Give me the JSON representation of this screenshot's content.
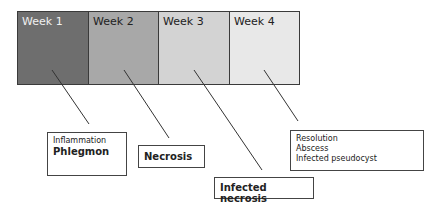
{
  "weeks": [
    {
      "label": "Week 1",
      "color": "#6e6e6e",
      "text_color": "#f0f0f0"
    },
    {
      "label": "Week 2",
      "color": "#a8a8a8",
      "text_color": "#222222"
    },
    {
      "label": "Week 3",
      "color": "#d3d3d3",
      "text_color": "#222222"
    },
    {
      "label": "Week 4",
      "color": "#e8e8e8",
      "text_color": "#222222"
    }
  ],
  "callouts": {
    "week1": {
      "line1": "Inflammation",
      "line2": "Phlegmon"
    },
    "week2": {
      "line1": "Necrosis"
    },
    "week3": {
      "line1": "Infected necrosis"
    },
    "week4": {
      "line1": "Resolution",
      "line2": "Abscess",
      "line3": "Infected pseudocyst"
    }
  }
}
